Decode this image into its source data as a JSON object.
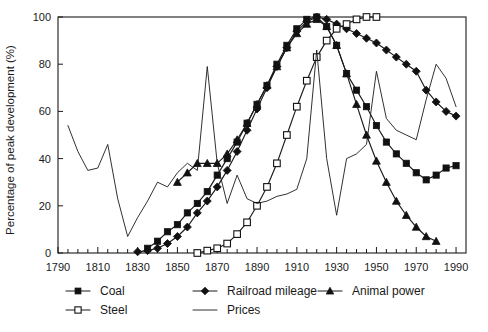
{
  "chart_data": {
    "type": "line",
    "title": "",
    "xlabel": "",
    "ylabel": "Percentage of peak development (%)",
    "xlim": [
      1790,
      1995
    ],
    "ylim": [
      0,
      100
    ],
    "grid": false,
    "legend_position": "bottom",
    "x_ticks_major": [
      1790,
      1810,
      1830,
      1850,
      1870,
      1890,
      1910,
      1930,
      1950,
      1970,
      1990
    ],
    "x_tick_interval_minor": 5,
    "y_ticks": [
      0,
      20,
      40,
      60,
      80,
      100
    ],
    "series": [
      {
        "name": "Coal",
        "marker": "filled-square",
        "x": [
          1835,
          1840,
          1845,
          1850,
          1855,
          1860,
          1865,
          1870,
          1875,
          1880,
          1885,
          1890,
          1895,
          1900,
          1905,
          1910,
          1915,
          1920,
          1925,
          1930,
          1935,
          1940,
          1945,
          1950,
          1955,
          1960,
          1965,
          1970,
          1975,
          1980,
          1985,
          1990
        ],
        "y": [
          2,
          5,
          9,
          12,
          17,
          21,
          26,
          33,
          40,
          47,
          55,
          63,
          71,
          80,
          88,
          95,
          99,
          100,
          96,
          88,
          76,
          69,
          62,
          54,
          47,
          42,
          38,
          34,
          31,
          33,
          36,
          37
        ]
      },
      {
        "name": "Railroad mileage",
        "marker": "filled-diamond",
        "x": [
          1830,
          1835,
          1840,
          1845,
          1850,
          1855,
          1860,
          1865,
          1870,
          1875,
          1880,
          1885,
          1890,
          1895,
          1900,
          1905,
          1910,
          1915,
          1920,
          1925,
          1930,
          1935,
          1940,
          1945,
          1950,
          1955,
          1960,
          1965,
          1970,
          1975,
          1980,
          1985,
          1990
        ],
        "y": [
          0.5,
          1,
          2,
          4,
          7,
          11,
          17,
          22,
          28,
          35,
          43,
          52,
          61,
          70,
          79,
          87,
          94,
          98,
          100,
          99,
          97,
          95,
          93,
          91,
          89,
          86,
          83,
          80,
          77,
          69,
          64,
          60,
          58
        ]
      },
      {
        "name": "Steel",
        "marker": "open-square",
        "x": [
          1860,
          1865,
          1870,
          1875,
          1880,
          1885,
          1890,
          1895,
          1900,
          1905,
          1910,
          1915,
          1920,
          1925,
          1930,
          1935,
          1940,
          1945,
          1950
        ],
        "y": [
          0,
          1,
          2,
          4,
          8,
          13,
          20,
          28,
          38,
          50,
          62,
          73,
          83,
          90,
          95,
          97,
          99,
          100,
          100
        ]
      },
      {
        "name": "Animal power",
        "marker": "filled-triangle",
        "x": [
          1850,
          1855,
          1860,
          1865,
          1870,
          1875,
          1880,
          1885,
          1890,
          1895,
          1900,
          1905,
          1910,
          1915,
          1920,
          1925,
          1930,
          1935,
          1940,
          1945,
          1950,
          1955,
          1960,
          1965,
          1970,
          1975,
          1980
        ],
        "y": [
          30,
          34,
          38,
          38,
          38,
          42,
          48,
          55,
          63,
          71,
          79,
          87,
          93,
          97,
          99,
          96,
          88,
          76,
          63,
          50,
          39,
          30,
          22,
          16,
          11,
          7,
          5
        ]
      },
      {
        "name": "Prices",
        "marker": "none",
        "x": [
          1795,
          1800,
          1805,
          1810,
          1815,
          1820,
          1825,
          1830,
          1835,
          1840,
          1845,
          1850,
          1855,
          1860,
          1865,
          1870,
          1875,
          1880,
          1885,
          1890,
          1895,
          1900,
          1905,
          1910,
          1915,
          1920,
          1925,
          1930,
          1935,
          1940,
          1945,
          1950,
          1955,
          1960,
          1965,
          1970,
          1975,
          1980,
          1985,
          1990
        ],
        "y": [
          54,
          43,
          35,
          36,
          46,
          23,
          7,
          15,
          22,
          30,
          28,
          34,
          38,
          35,
          79,
          38,
          21,
          33,
          23,
          21,
          22,
          24,
          25,
          27,
          40,
          86,
          40,
          16,
          40,
          42,
          46,
          77,
          57,
          52,
          50,
          48,
          65,
          80,
          74,
          62
        ]
      }
    ]
  },
  "axis": {
    "y_label": "Percentage of peak development (%)",
    "y_tick_labels": [
      "0",
      "20",
      "40",
      "60",
      "80",
      "100"
    ],
    "x_tick_labels": [
      "1790",
      "1810",
      "1830",
      "1850",
      "1870",
      "1890",
      "1910",
      "1930",
      "1950",
      "1970",
      "1990"
    ]
  },
  "legend": {
    "entries": [
      {
        "label": "Coal",
        "marker": "filled-square"
      },
      {
        "label": "Railroad mileage",
        "marker": "filled-diamond"
      },
      {
        "label": "Animal power",
        "marker": "filled-triangle"
      },
      {
        "label": "Steel",
        "marker": "open-square"
      },
      {
        "label": "Prices",
        "marker": "plain-line"
      }
    ]
  },
  "colors": {
    "ink": "#1a1a1a",
    "background": "#ffffff"
  }
}
